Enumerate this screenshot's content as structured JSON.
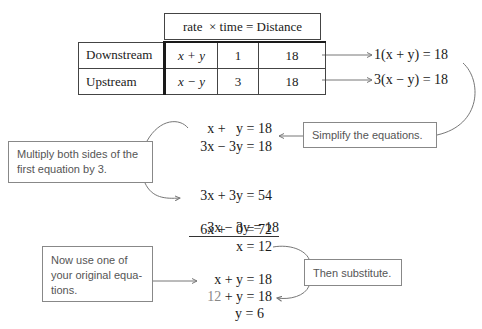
{
  "header_row": {
    "label": "rate  × time = Distance"
  },
  "table": {
    "columns": [
      "rate",
      "time",
      "Distance"
    ],
    "rows": [
      {
        "label": "Downstream",
        "rate": "x + y",
        "time": "1",
        "distance": "18"
      },
      {
        "label": "Upstream",
        "rate": "x − y",
        "time": "3",
        "distance": "18"
      }
    ]
  },
  "derived_equations": [
    "1(x + y) = 18",
    "3(x − y) = 18"
  ],
  "simplified": [
    "x +   y = 18",
    "3x − 3y = 18"
  ],
  "elimination": [
    "3x + 3y = 54",
    "3x − 3y = 18",
    "6x +   0 = 72",
    "x = 12"
  ],
  "substitution": [
    "x + y = 18",
    "12",
    " + y = 18",
    "y = 6"
  ],
  "callouts": {
    "simplify": "Simplify the equations.",
    "multiply": "Multiply both sides of the first equation by 3.",
    "now_use": "Now use one of your original equa- tions.",
    "substitute": "Then substitute."
  }
}
